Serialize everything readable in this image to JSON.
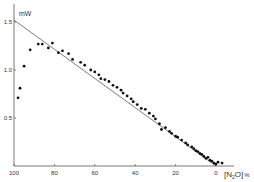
{
  "chart_data": {
    "type": "scatter",
    "title": "",
    "xlabel": "[N2O] %",
    "ylabel": "mW",
    "xlim": [
      100,
      0
    ],
    "ylim": [
      0,
      1.6
    ],
    "x_reversed": true,
    "grid": false,
    "legend": null,
    "xticks": [
      100,
      80,
      60,
      40,
      20,
      0
    ],
    "yticks": [
      0.5,
      1.0,
      1.5
    ],
    "ytick_labels": [
      "0.5",
      "1.0",
      "1.5"
    ],
    "xtick_labels": [
      "100",
      "80",
      "60",
      "40",
      "20",
      "0"
    ],
    "fit_line": {
      "x": [
        100,
        0
      ],
      "y": [
        1.52,
        0.0
      ]
    },
    "series": [
      {
        "name": "measured",
        "points": [
          [
            98,
            0.71
          ],
          [
            97,
            0.81
          ],
          [
            95,
            1.04
          ],
          [
            92,
            1.21
          ],
          [
            88,
            1.27
          ],
          [
            86,
            1.27
          ],
          [
            83,
            1.23
          ],
          [
            81,
            1.28
          ],
          [
            78,
            1.18
          ],
          [
            76,
            1.2
          ],
          [
            73,
            1.17
          ],
          [
            71,
            1.11
          ],
          [
            67,
            1.08
          ],
          [
            65,
            1.05
          ],
          [
            62,
            1.0
          ],
          [
            60,
            0.98
          ],
          [
            58,
            0.95
          ],
          [
            57,
            0.91
          ],
          [
            55,
            0.9
          ],
          [
            53,
            0.88
          ],
          [
            51,
            0.84
          ],
          [
            49,
            0.82
          ],
          [
            47,
            0.79
          ],
          [
            46,
            0.76
          ],
          [
            44,
            0.73
          ],
          [
            42,
            0.7
          ],
          [
            41,
            0.67
          ],
          [
            39,
            0.64
          ],
          [
            37,
            0.6
          ],
          [
            35,
            0.59
          ],
          [
            33,
            0.55
          ],
          [
            31,
            0.52
          ],
          [
            30,
            0.49
          ],
          [
            28,
            0.44
          ],
          [
            27,
            0.38
          ],
          [
            25,
            0.4
          ],
          [
            23,
            0.36
          ],
          [
            22,
            0.34
          ],
          [
            20,
            0.31
          ],
          [
            19,
            0.3
          ],
          [
            17,
            0.27
          ],
          [
            15,
            0.24
          ],
          [
            14,
            0.22
          ],
          [
            12,
            0.2
          ],
          [
            11,
            0.18
          ],
          [
            10,
            0.16
          ],
          [
            9,
            0.15
          ],
          [
            8,
            0.13
          ],
          [
            7,
            0.12
          ],
          [
            6,
            0.1
          ],
          [
            5,
            0.08
          ],
          [
            4,
            0.09
          ],
          [
            3,
            0.06
          ],
          [
            2,
            0.05
          ],
          [
            1,
            0.03
          ],
          [
            0,
            0.02
          ],
          [
            -1,
            0.04
          ],
          [
            -3,
            0.03
          ]
        ]
      }
    ]
  },
  "labels": {
    "y_unit": "mW",
    "x_axis_title_main": "[N",
    "x_axis_title_sub": "2",
    "x_axis_title_end": "O]",
    "x_axis_percent": "%"
  },
  "colors": {
    "axis": "#555555",
    "points": "#111111",
    "line": "#444444"
  }
}
